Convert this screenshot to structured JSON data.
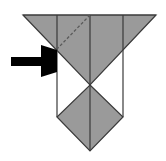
{
  "diagram": {
    "type": "origami-fold-step",
    "colors": {
      "background": "#ffffff",
      "paper_fill": "#9a9a9a",
      "line": "#3a3a3a",
      "arrow": "#000000"
    },
    "shapes": {
      "top_triangle": {
        "points": "23,15 156,15 90,85"
      },
      "diamond": {
        "points": "90,85 123,117 90,151 57,117"
      },
      "strip_outline": {
        "left_x": 57,
        "right_x": 123,
        "top_y": 15,
        "bottom_y": 117
      },
      "center_line": {
        "x": 90,
        "y1": 15,
        "y2": 151
      },
      "dashed_fold": {
        "x1": 90,
        "y1": 15,
        "x2": 57,
        "y2": 49
      },
      "arrow": {
        "points": "11,57 41,57 41,45 57,50 57,72 41,77 41,66 11,66",
        "direction": "right",
        "target": "left fold corner"
      }
    }
  }
}
